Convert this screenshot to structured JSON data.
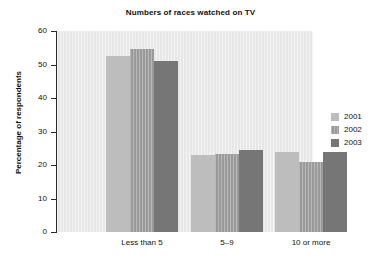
{
  "chart_data": {
    "type": "bar",
    "title": "Numbers of races watched on TV",
    "xlabel": "",
    "ylabel": "Percentage of respondents",
    "categories": [
      "Less than 5",
      "5–9",
      "10 or more"
    ],
    "series": [
      {
        "name": "2001",
        "color": "#bdbdbd",
        "values": [
          52.5,
          23.0,
          24.0
        ]
      },
      {
        "name": "2002",
        "color": "#9a9a9a",
        "values": [
          54.5,
          23.2,
          21.0
        ]
      },
      {
        "name": "2003",
        "color": "#767676",
        "values": [
          51.0,
          24.4,
          24.0
        ]
      }
    ],
    "ylim": [
      0,
      60
    ],
    "yticks": [
      0,
      10,
      20,
      30,
      40,
      50,
      60
    ],
    "ytick_labels": [
      "0",
      "10",
      "20",
      "30",
      "40",
      "50",
      "60"
    ],
    "grid": false,
    "legend_position": "right",
    "plot_background": "#e7e7e7",
    "axis_color": "#2a2a2a"
  }
}
